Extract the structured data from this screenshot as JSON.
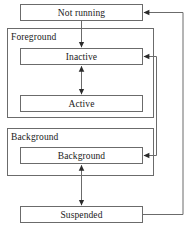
{
  "diagram": {
    "type": "state-diagram",
    "canvas": {
      "width": 188,
      "height": 228
    },
    "style": {
      "background": "#ffffff",
      "stroke": "#6b6b6b",
      "box_fill": "#ffffff",
      "text": "#1a1a1a",
      "arrow": "#2b2b2b"
    },
    "groups": [
      {
        "id": "foreground",
        "label": "Foreground",
        "x": 7,
        "y": 28,
        "w": 147,
        "h": 90,
        "label_x": 11,
        "label_y": 33
      },
      {
        "id": "background-group",
        "label": "Background",
        "x": 7,
        "y": 128,
        "w": 147,
        "h": 48,
        "label_x": 11,
        "label_y": 133
      }
    ],
    "states": [
      {
        "id": "not-running",
        "label": "Not running",
        "x": 20,
        "y": 4,
        "w": 123,
        "h": 17
      },
      {
        "id": "inactive",
        "label": "Inactive",
        "x": 20,
        "y": 48,
        "w": 123,
        "h": 17
      },
      {
        "id": "active",
        "label": "Active",
        "x": 20,
        "y": 95,
        "w": 123,
        "h": 17
      },
      {
        "id": "background",
        "label": "Background",
        "x": 20,
        "y": 147,
        "w": 123,
        "h": 17
      },
      {
        "id": "suspended",
        "label": "Suspended",
        "x": 20,
        "y": 206,
        "w": 123,
        "h": 17
      }
    ],
    "transitions": [
      {
        "id": "notrunning-to-inactive",
        "from": "not-running",
        "to": "inactive",
        "direction": "down",
        "arrowheads": "end"
      },
      {
        "id": "inactive-active",
        "from": "inactive",
        "to": "active",
        "direction": "vertical",
        "arrowheads": "both"
      },
      {
        "id": "background-suspended",
        "from": "background",
        "to": "suspended",
        "direction": "vertical",
        "arrowheads": "both"
      },
      {
        "id": "inactive-to-background",
        "from": "inactive",
        "to": "background",
        "direction": "right-side-loop",
        "arrowheads": "both"
      },
      {
        "id": "suspended-to-notrunning",
        "from": "suspended",
        "to": "not-running",
        "direction": "outer-right-loop",
        "arrowheads": "end"
      }
    ]
  }
}
